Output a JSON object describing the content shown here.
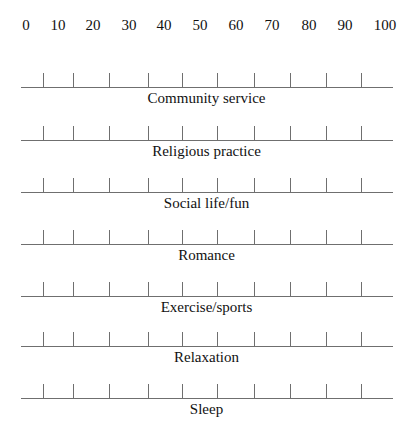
{
  "scale": {
    "labels": [
      "0",
      "10",
      "20",
      "30",
      "40",
      "50",
      "60",
      "70",
      "80",
      "90",
      "100"
    ],
    "label_x": [
      26,
      58,
      93,
      129,
      164,
      200,
      236,
      272,
      309,
      345,
      385
    ]
  },
  "ticks_x": [
    43,
    73,
    109,
    148,
    182,
    217,
    254,
    290,
    326,
    361
  ],
  "line": {
    "x_start": 21,
    "x_end": 393,
    "color": "#6f6f6f"
  },
  "rows": [
    {
      "label": "Community service",
      "line_y": 87
    },
    {
      "label": "Religious practice",
      "line_y": 140
    },
    {
      "label": "Social life/fun",
      "line_y": 192
    },
    {
      "label": "Romance",
      "line_y": 244
    },
    {
      "label": "Exercise/sports",
      "line_y": 296
    },
    {
      "label": "Relaxation",
      "line_y": 346
    },
    {
      "label": "Sleep",
      "line_y": 398
    }
  ]
}
